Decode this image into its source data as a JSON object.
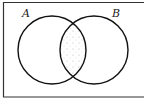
{
  "diagram": {
    "type": "venn",
    "universe_label": "",
    "sets": [
      {
        "id": "A",
        "label": "A"
      },
      {
        "id": "B",
        "label": "B"
      }
    ],
    "shaded_region": "A ∩ B",
    "shading_style": "stipple",
    "colors": {
      "line": "#111111",
      "background": "#ffffff",
      "shading": "#aaaaaa"
    }
  }
}
